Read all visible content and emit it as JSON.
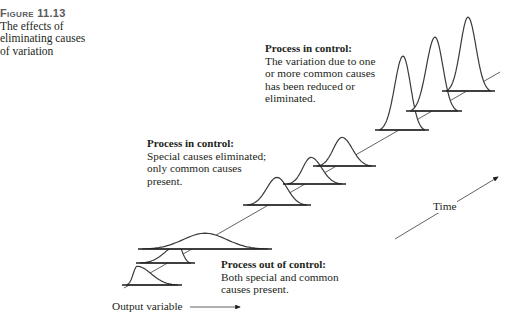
{
  "caption": {
    "figure_number": "Figure 11.13",
    "lines": [
      "The effects of",
      "eliminating causes",
      "of variation"
    ]
  },
  "annotations": {
    "top": {
      "heading": "Process in control:",
      "lines": [
        "The variation due to one",
        "or more common causes",
        "has been reduced or",
        "eliminated."
      ]
    },
    "middle": {
      "heading": "Process in control:",
      "lines": [
        "Special causes eliminated;",
        "only common causes",
        "present."
      ]
    },
    "bottom": {
      "heading": "Process out of control:",
      "lines": [
        "Both special and common",
        "causes present."
      ]
    }
  },
  "axes": {
    "x_label": "Output variable",
    "time_label": "Time"
  },
  "colors": {
    "line": "#3a3a3a",
    "text": "#231f20",
    "caption_heading": "#5a5a5a"
  },
  "distributions": [
    {
      "stage": "out-of-control",
      "shape": "skewed",
      "x0": 126,
      "x1": 178,
      "peak_x": 137,
      "base_y": 285,
      "peak_y": 266
    },
    {
      "stage": "out-of-control",
      "shape": "skewed",
      "x0": 140,
      "x1": 191,
      "peak_x": 178,
      "base_y": 263,
      "peak_y": 245
    },
    {
      "stage": "out-of-control",
      "shape": "wide",
      "x0": 142,
      "x1": 268,
      "peak_x": 205,
      "base_y": 249,
      "peak_y": 233
    },
    {
      "stage": "in-control-common",
      "shape": "normal",
      "x0": 247,
      "x1": 307,
      "peak_x": 277,
      "base_y": 205,
      "peak_y": 177
    },
    {
      "stage": "in-control-common",
      "shape": "normal",
      "x0": 287,
      "x1": 342,
      "peak_x": 311,
      "base_y": 184,
      "peak_y": 157
    },
    {
      "stage": "in-control-common",
      "shape": "normal",
      "x0": 317,
      "x1": 372,
      "peak_x": 342,
      "base_y": 166,
      "peak_y": 137
    },
    {
      "stage": "in-control-reduced",
      "shape": "tall",
      "x0": 379,
      "x1": 425,
      "peak_x": 403,
      "base_y": 130,
      "peak_y": 55
    },
    {
      "stage": "in-control-reduced",
      "shape": "tall",
      "x0": 410,
      "x1": 458,
      "peak_x": 435,
      "base_y": 111,
      "peak_y": 36
    },
    {
      "stage": "in-control-reduced",
      "shape": "tall",
      "x0": 446,
      "x1": 491,
      "peak_x": 468,
      "base_y": 91,
      "peak_y": 16
    }
  ]
}
